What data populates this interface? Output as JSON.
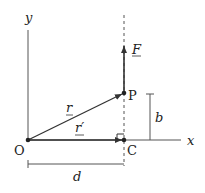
{
  "diagram": {
    "labels": {
      "y_axis": "y",
      "x_axis": "x",
      "origin": "O",
      "point_p": "P",
      "point_c": "C",
      "force": "F",
      "vector_r": "r",
      "vector_r_prime": "r′",
      "height_b": "b",
      "distance_d": "d"
    },
    "colors": {
      "line": "#333333",
      "text": "#222222",
      "background": "#ffffff"
    }
  }
}
